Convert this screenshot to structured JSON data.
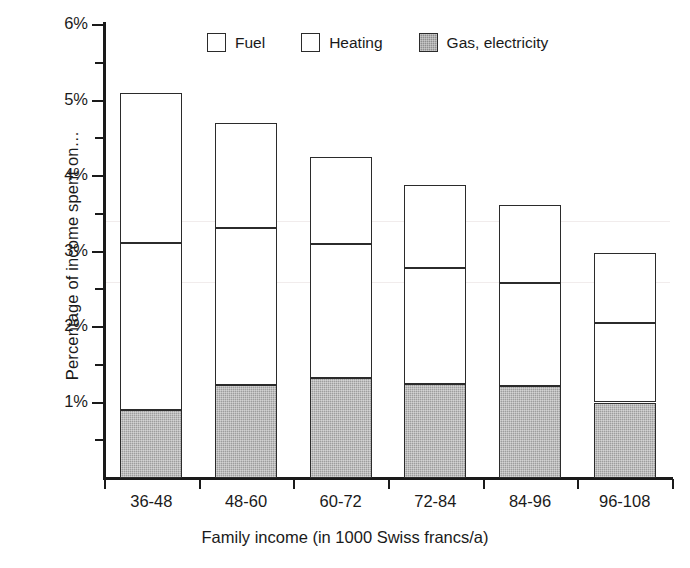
{
  "chart_data": {
    "type": "bar",
    "stacked": true,
    "title": "",
    "xlabel": "Family income (in 1000 Swiss francs/a)",
    "ylabel": "Percentage of income spent on…",
    "categories": [
      "36-48",
      "48-60",
      "60-72",
      "72-84",
      "84-96",
      "96-108"
    ],
    "ylim": [
      0,
      6
    ],
    "ytick_labels": [
      "1%",
      "2%",
      "3%",
      "4%",
      "5%",
      "6%"
    ],
    "ytick_values": [
      1,
      2,
      3,
      4,
      5,
      6
    ],
    "yminor_values": [
      0.5,
      1.5,
      2.5,
      3.5,
      4.5,
      5.5
    ],
    "y_unit": "%",
    "grid": false,
    "legend_position": "top",
    "series": [
      {
        "name": "Gas, electricity",
        "style": "hatched-gray",
        "color": "#9d9d9d",
        "values": [
          0.9,
          1.23,
          1.32,
          1.24,
          1.22,
          1.0
        ]
      },
      {
        "name": "Heating",
        "style": "white-outline",
        "color": "#ffffff",
        "values": [
          2.21,
          2.08,
          1.78,
          1.54,
          1.36,
          1.05
        ]
      },
      {
        "name": "Fuel",
        "style": "white-outline",
        "color": "#ffffff",
        "values": [
          1.99,
          1.39,
          1.15,
          1.1,
          1.04,
          0.93
        ]
      }
    ],
    "cumulative_tops": {
      "gas_electricity": [
        0.9,
        1.23,
        1.32,
        1.24,
        1.22,
        1.0
      ],
      "heating": [
        3.11,
        3.31,
        3.1,
        2.78,
        2.58,
        2.05
      ],
      "fuel_total": [
        5.1,
        4.7,
        4.25,
        3.88,
        3.62,
        2.98
      ]
    },
    "totals": [
      5.1,
      4.7,
      4.25,
      3.88,
      3.62,
      2.98
    ]
  },
  "legend": {
    "items": [
      {
        "label": "Fuel",
        "swatch": "white-square-icon"
      },
      {
        "label": "Heating",
        "swatch": "white-square-icon"
      },
      {
        "label": "Gas, electricity",
        "swatch": "hatched-square-icon"
      }
    ]
  },
  "axes": {
    "y_title": "Percentage of income spent on…",
    "x_title": "Family income (in 1000 Swiss francs/a)"
  }
}
